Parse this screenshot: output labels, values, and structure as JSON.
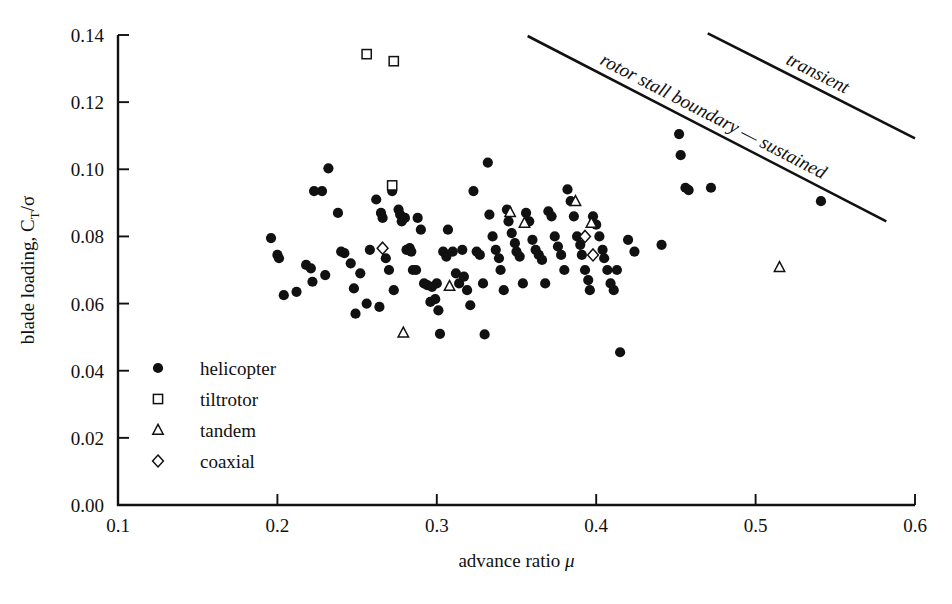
{
  "figure": {
    "caption_partial": ""
  },
  "chart_data": {
    "type": "scatter",
    "title": "",
    "xlabel": "advance ratio μ",
    "ylabel": "blade loading, C_T/σ",
    "ylabel_parts": {
      "main": "blade loading, C",
      "sub": "T",
      "tail": "/σ"
    },
    "xlim": [
      0.1,
      0.6
    ],
    "ylim": [
      0.0,
      0.14
    ],
    "xticks": [
      0.1,
      0.2,
      0.3,
      0.4,
      0.5,
      0.6
    ],
    "xtick_labels": [
      "0.1",
      "0.2",
      "0.3",
      "0.4",
      "0.5",
      "0.6"
    ],
    "yticks": [
      0.0,
      0.02,
      0.04,
      0.06,
      0.08,
      0.1,
      0.12,
      0.14
    ],
    "ytick_labels": [
      "0.00",
      "0.02",
      "0.04",
      "0.06",
      "0.08",
      "0.10",
      "0.12",
      "0.14"
    ],
    "grid": false,
    "legend_position": "lower-left-inside",
    "legend": [
      {
        "key": "helicopter",
        "label": "helicopter",
        "marker": "filled-circle"
      },
      {
        "key": "tiltrotor",
        "label": "tiltrotor",
        "marker": "open-square"
      },
      {
        "key": "tandem",
        "label": "tandem",
        "marker": "open-triangle"
      },
      {
        "key": "coaxial",
        "label": "coaxial",
        "marker": "open-diamond"
      }
    ],
    "series": [
      {
        "name": "helicopter",
        "marker": "filled-circle",
        "points": [
          [
            0.196,
            0.0795
          ],
          [
            0.2,
            0.0745
          ],
          [
            0.201,
            0.0735
          ],
          [
            0.204,
            0.0625
          ],
          [
            0.212,
            0.0635
          ],
          [
            0.218,
            0.0715
          ],
          [
            0.221,
            0.0705
          ],
          [
            0.222,
            0.0665
          ],
          [
            0.223,
            0.0935
          ],
          [
            0.228,
            0.0935
          ],
          [
            0.23,
            0.0685
          ],
          [
            0.232,
            0.1003
          ],
          [
            0.238,
            0.087
          ],
          [
            0.24,
            0.0755
          ],
          [
            0.242,
            0.075
          ],
          [
            0.246,
            0.072
          ],
          [
            0.248,
            0.0645
          ],
          [
            0.249,
            0.057
          ],
          [
            0.252,
            0.069
          ],
          [
            0.256,
            0.06
          ],
          [
            0.258,
            0.076
          ],
          [
            0.262,
            0.091
          ],
          [
            0.264,
            0.059
          ],
          [
            0.265,
            0.087
          ],
          [
            0.266,
            0.0855
          ],
          [
            0.268,
            0.0735
          ],
          [
            0.27,
            0.07
          ],
          [
            0.272,
            0.0935
          ],
          [
            0.273,
            0.064
          ],
          [
            0.276,
            0.088
          ],
          [
            0.277,
            0.0865
          ],
          [
            0.278,
            0.0845
          ],
          [
            0.28,
            0.0855
          ],
          [
            0.281,
            0.076
          ],
          [
            0.283,
            0.0765
          ],
          [
            0.284,
            0.0755
          ],
          [
            0.285,
            0.07
          ],
          [
            0.287,
            0.07
          ],
          [
            0.288,
            0.0855
          ],
          [
            0.29,
            0.082
          ],
          [
            0.292,
            0.066
          ],
          [
            0.294,
            0.0655
          ],
          [
            0.296,
            0.0605
          ],
          [
            0.297,
            0.065
          ],
          [
            0.299,
            0.0613
          ],
          [
            0.3,
            0.066
          ],
          [
            0.301,
            0.058
          ],
          [
            0.302,
            0.051
          ],
          [
            0.304,
            0.0755
          ],
          [
            0.306,
            0.074
          ],
          [
            0.307,
            0.082
          ],
          [
            0.31,
            0.0755
          ],
          [
            0.312,
            0.069
          ],
          [
            0.314,
            0.066
          ],
          [
            0.316,
            0.076
          ],
          [
            0.317,
            0.068
          ],
          [
            0.319,
            0.064
          ],
          [
            0.321,
            0.0595
          ],
          [
            0.323,
            0.0935
          ],
          [
            0.325,
            0.0755
          ],
          [
            0.327,
            0.0745
          ],
          [
            0.329,
            0.066
          ],
          [
            0.33,
            0.0508
          ],
          [
            0.332,
            0.102
          ],
          [
            0.333,
            0.0865
          ],
          [
            0.335,
            0.08
          ],
          [
            0.337,
            0.076
          ],
          [
            0.339,
            0.0735
          ],
          [
            0.34,
            0.07
          ],
          [
            0.342,
            0.064
          ],
          [
            0.344,
            0.088
          ],
          [
            0.345,
            0.0845
          ],
          [
            0.347,
            0.081
          ],
          [
            0.349,
            0.078
          ],
          [
            0.35,
            0.0755
          ],
          [
            0.352,
            0.074
          ],
          [
            0.354,
            0.066
          ],
          [
            0.356,
            0.087
          ],
          [
            0.358,
            0.0845
          ],
          [
            0.36,
            0.079
          ],
          [
            0.362,
            0.076
          ],
          [
            0.364,
            0.0745
          ],
          [
            0.366,
            0.073
          ],
          [
            0.368,
            0.066
          ],
          [
            0.37,
            0.0875
          ],
          [
            0.372,
            0.086
          ],
          [
            0.374,
            0.08
          ],
          [
            0.376,
            0.077
          ],
          [
            0.378,
            0.0745
          ],
          [
            0.38,
            0.07
          ],
          [
            0.382,
            0.094
          ],
          [
            0.384,
            0.0905
          ],
          [
            0.386,
            0.086
          ],
          [
            0.388,
            0.08
          ],
          [
            0.39,
            0.0775
          ],
          [
            0.391,
            0.0745
          ],
          [
            0.393,
            0.07
          ],
          [
            0.395,
            0.067
          ],
          [
            0.396,
            0.064
          ],
          [
            0.398,
            0.086
          ],
          [
            0.4,
            0.0835
          ],
          [
            0.402,
            0.08
          ],
          [
            0.404,
            0.076
          ],
          [
            0.405,
            0.0735
          ],
          [
            0.407,
            0.07
          ],
          [
            0.409,
            0.066
          ],
          [
            0.411,
            0.064
          ],
          [
            0.413,
            0.07
          ],
          [
            0.415,
            0.0455
          ],
          [
            0.42,
            0.079
          ],
          [
            0.424,
            0.0755
          ],
          [
            0.441,
            0.0775
          ],
          [
            0.452,
            0.1105
          ],
          [
            0.453,
            0.1042
          ],
          [
            0.456,
            0.0945
          ],
          [
            0.458,
            0.0938
          ],
          [
            0.472,
            0.0945
          ],
          [
            0.541,
            0.0905
          ]
        ]
      },
      {
        "name": "tiltrotor",
        "marker": "open-square",
        "points": [
          [
            0.256,
            0.1343
          ],
          [
            0.273,
            0.1322
          ],
          [
            0.272,
            0.0952
          ]
        ]
      },
      {
        "name": "tandem",
        "marker": "open-triangle",
        "points": [
          [
            0.279,
            0.0513
          ],
          [
            0.308,
            0.0652
          ],
          [
            0.346,
            0.0872
          ],
          [
            0.355,
            0.084
          ],
          [
            0.387,
            0.0905
          ],
          [
            0.397,
            0.084
          ],
          [
            0.515,
            0.0708
          ]
        ]
      },
      {
        "name": "coaxial",
        "marker": "open-diamond",
        "points": [
          [
            0.266,
            0.0765
          ],
          [
            0.393,
            0.08
          ],
          [
            0.398,
            0.0745
          ]
        ]
      }
    ],
    "annotations": [
      {
        "key": "sustained-boundary",
        "text": "rotor stall boundary — sustained",
        "line": {
          "x1": 0.357,
          "y1": 0.1397,
          "x2": 0.582,
          "y2": 0.0845
        }
      },
      {
        "key": "transient-boundary",
        "text": "transient",
        "line": {
          "x1": 0.47,
          "y1": 0.1405,
          "x2": 0.6,
          "y2": 0.1092
        }
      }
    ]
  }
}
